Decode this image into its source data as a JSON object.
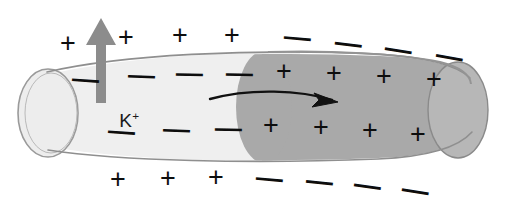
{
  "figure": {
    "canvas": {
      "width": 524,
      "height": 207,
      "background": "#ffffff"
    }
  },
  "colors": {
    "resting_region": "#efefef",
    "depolarized_region": "#a9a9a9",
    "depolarized_cap": "#b7b7b7",
    "resting_cap": "#ededed",
    "outline": "#8f8f8f",
    "efflux_arrow": "#8c8c8c",
    "propagation_arrow": "#111111",
    "sign_color": "#0d0d0d"
  },
  "labels": {
    "potassium_ion": "K",
    "potassium_charge": "+"
  },
  "glyphs": {
    "plus": "+",
    "minus": "—"
  },
  "charges": {
    "outside_top": [
      {
        "glyph": "+",
        "x": 60,
        "y": 30,
        "rot": 0
      },
      {
        "glyph": "+",
        "x": 118,
        "y": 24,
        "rot": 0
      },
      {
        "glyph": "+",
        "x": 172,
        "y": 22,
        "rot": 0
      },
      {
        "glyph": "+",
        "x": 224,
        "y": 22,
        "rot": 0
      },
      {
        "glyph": "—",
        "x": 284,
        "y": 24,
        "rot": 5
      },
      {
        "glyph": "—",
        "x": 335,
        "y": 30,
        "rot": 7
      },
      {
        "glyph": "—",
        "x": 385,
        "y": 36,
        "rot": 9
      },
      {
        "glyph": "—",
        "x": 436,
        "y": 43,
        "rot": 10
      }
    ],
    "inside_top": [
      {
        "glyph": "—",
        "x": 72,
        "y": 66,
        "rot": 4
      },
      {
        "glyph": "—",
        "x": 128,
        "y": 62,
        "rot": 2
      },
      {
        "glyph": "—",
        "x": 176,
        "y": 60,
        "rot": 1
      },
      {
        "glyph": "—",
        "x": 226,
        "y": 60,
        "rot": 1
      },
      {
        "glyph": "+",
        "x": 276,
        "y": 58,
        "rot": 0
      },
      {
        "glyph": "+",
        "x": 326,
        "y": 60,
        "rot": 0
      },
      {
        "glyph": "+",
        "x": 376,
        "y": 63,
        "rot": 0
      },
      {
        "glyph": "+",
        "x": 426,
        "y": 66,
        "rot": 0
      }
    ],
    "inside_bottom": [
      {
        "glyph": "—",
        "x": 108,
        "y": 118,
        "rot": 4
      },
      {
        "glyph": "—",
        "x": 163,
        "y": 116,
        "rot": 2
      },
      {
        "glyph": "—",
        "x": 215,
        "y": 115,
        "rot": 1
      },
      {
        "glyph": "+",
        "x": 263,
        "y": 112,
        "rot": 0
      },
      {
        "glyph": "+",
        "x": 313,
        "y": 114,
        "rot": 0
      },
      {
        "glyph": "+",
        "x": 362,
        "y": 117,
        "rot": 0
      },
      {
        "glyph": "+",
        "x": 410,
        "y": 121,
        "rot": 0
      }
    ],
    "outside_bottom": [
      {
        "glyph": "+",
        "x": 110,
        "y": 166,
        "rot": 0
      },
      {
        "glyph": "+",
        "x": 160,
        "y": 165,
        "rot": 0
      },
      {
        "glyph": "+",
        "x": 208,
        "y": 164,
        "rot": 0
      },
      {
        "glyph": "—",
        "x": 256,
        "y": 165,
        "rot": 5
      },
      {
        "glyph": "—",
        "x": 306,
        "y": 168,
        "rot": 6
      },
      {
        "glyph": "—",
        "x": 354,
        "y": 172,
        "rot": 8
      },
      {
        "glyph": "—",
        "x": 402,
        "y": 177,
        "rot": 9
      }
    ]
  },
  "arrows": {
    "efflux": {
      "name": "potassium-efflux-arrow",
      "direction": "up"
    },
    "propagation": {
      "name": "impulse-propagation-arrow",
      "direction": "right"
    }
  }
}
